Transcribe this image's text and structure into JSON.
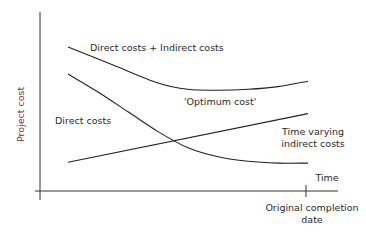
{
  "chart_data": {
    "type": "line",
    "title": "",
    "xlabel": "Time",
    "ylabel": "Project cost",
    "ylabel_color": "#8b2a3a",
    "grid": false,
    "x_range": [
      0,
      1
    ],
    "y_range": [
      0,
      1
    ],
    "x_ticks": [
      {
        "x": 0.9,
        "label": "Original completion date"
      }
    ],
    "series": [
      {
        "name": "Direct costs + Indirect costs",
        "x": [
          0.1,
          0.25,
          0.4,
          0.5,
          0.6,
          0.7,
          0.8,
          0.9
        ],
        "y": [
          0.8,
          0.7,
          0.6,
          0.565,
          0.56,
          0.565,
          0.58,
          0.61
        ]
      },
      {
        "name": "Direct costs",
        "x": [
          0.1,
          0.2,
          0.3,
          0.4,
          0.5,
          0.6,
          0.7,
          0.8,
          0.9
        ],
        "y": [
          0.65,
          0.55,
          0.44,
          0.33,
          0.24,
          0.19,
          0.165,
          0.155,
          0.155
        ]
      },
      {
        "name": "Time varying indirect costs",
        "x": [
          0.1,
          0.9
        ],
        "y": [
          0.16,
          0.43
        ]
      }
    ],
    "annotations": [
      {
        "text": "Direct costs + Indirect costs",
        "target": "Direct costs + Indirect costs"
      },
      {
        "text": "'Optimum cost'",
        "target": "minimum of total cost"
      },
      {
        "text": "Direct costs",
        "target": "Direct costs"
      },
      {
        "text": "Time varying",
        "target": "Time varying indirect costs"
      },
      {
        "text": "indirect costs",
        "target": "Time varying indirect costs"
      }
    ]
  }
}
